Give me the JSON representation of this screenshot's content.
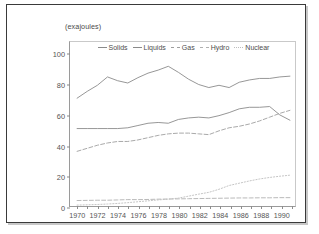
{
  "figure": {
    "units_label": "(exajoules)"
  },
  "chart_data": {
    "type": "line",
    "title": "",
    "subtitle": "",
    "units": "(exajoules)",
    "xlabel": "",
    "ylabel": "",
    "grid": false,
    "legend_position": "top-center",
    "xlim": [
      1969.3,
      1991.5
    ],
    "ylim": [
      0,
      108
    ],
    "yticks": [
      0,
      20,
      40,
      60,
      80,
      100
    ],
    "ytick_labels": [
      "0",
      "20",
      "40",
      "60",
      "80",
      "100"
    ],
    "x": [
      1970,
      1971,
      1972,
      1973,
      1974,
      1975,
      1976,
      1977,
      1978,
      1979,
      1980,
      1981,
      1982,
      1983,
      1984,
      1985,
      1986,
      1987,
      1988,
      1989,
      1990,
      1991
    ],
    "xtick_labels": [
      "1970",
      "1972",
      "1974",
      "1976",
      "1978",
      "1980",
      "1982",
      "1984",
      "1986",
      "1988",
      "1990"
    ],
    "xtick_years": [
      1970,
      1972,
      1974,
      1976,
      1978,
      1980,
      1982,
      1984,
      1986,
      1988,
      1990
    ],
    "series": [
      {
        "name": "Solids",
        "style": "solid",
        "color": "#8a8a8a",
        "values": [
          71.0,
          75.5,
          79.5,
          85.0,
          82.5,
          81.0,
          84.5,
          87.5,
          89.5,
          92.0,
          88.0,
          83.5,
          80.0,
          78.0,
          79.5,
          78.0,
          81.5,
          83.0,
          84.0,
          84.0,
          85.0,
          85.5
        ]
      },
      {
        "name": "Liquids",
        "style": "solid",
        "color": "#8a8a8a",
        "values": [
          51.0,
          51.0,
          51.0,
          51.0,
          51.0,
          51.5,
          53.0,
          54.5,
          55.0,
          54.5,
          57.0,
          58.0,
          58.5,
          58.0,
          59.5,
          61.5,
          64.0,
          65.0,
          65.0,
          65.5,
          60.0,
          56.5
        ]
      },
      {
        "name": "Gas",
        "style": "dashed",
        "color": "#9e9e9e",
        "values": [
          36.0,
          38.0,
          40.0,
          41.5,
          42.5,
          42.5,
          43.5,
          45.0,
          46.5,
          47.5,
          48.0,
          48.0,
          47.5,
          47.0,
          49.5,
          51.5,
          52.5,
          54.0,
          56.0,
          58.5,
          61.0,
          63.0
        ]
      },
      {
        "name": "Hydro",
        "style": "dashed",
        "color": "#b0b0b0",
        "values": [
          3.6,
          3.7,
          3.8,
          3.8,
          4.0,
          4.2,
          4.2,
          4.3,
          4.5,
          4.6,
          4.7,
          4.8,
          4.9,
          5.0,
          5.1,
          5.2,
          5.3,
          5.3,
          5.4,
          5.4,
          5.5,
          5.5
        ]
      },
      {
        "name": "Nuclear",
        "style": "dotted",
        "color": "#bdbdbd",
        "values": [
          0.6,
          0.8,
          1.0,
          1.3,
          1.7,
          2.2,
          2.8,
          3.4,
          4.0,
          4.5,
          5.2,
          6.5,
          7.8,
          9.0,
          11.0,
          13.5,
          15.0,
          16.5,
          17.8,
          18.8,
          19.6,
          20.3
        ]
      }
    ]
  }
}
